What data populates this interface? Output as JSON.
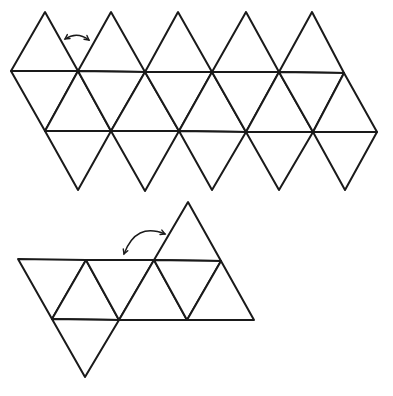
{
  "diagram": {
    "title": "",
    "colors": {
      "stroke": "#1a1a1a",
      "background": "#ffffff"
    },
    "icosahedron_net": {
      "triangle_count": 20,
      "vertices_rows": {
        "top_apexes": [
          [
            45,
            12
          ],
          [
            111,
            12
          ],
          [
            178,
            12
          ],
          [
            246,
            12
          ],
          [
            312,
            12
          ]
        ],
        "upper_row": [
          [
            11,
            71
          ],
          [
            78,
            71
          ],
          [
            145,
            72
          ],
          [
            212,
            72
          ],
          [
            279,
            72
          ],
          [
            344,
            73
          ]
        ],
        "lower_row": [
          [
            45,
            131
          ],
          [
            111,
            131
          ],
          [
            179,
            131
          ],
          [
            246,
            132
          ],
          [
            313,
            132
          ],
          [
            377,
            132
          ]
        ],
        "bottom_points": [
          [
            78,
            190
          ],
          [
            145,
            191
          ],
          [
            212,
            190
          ],
          [
            279,
            190
          ],
          [
            345,
            190
          ]
        ]
      },
      "fold_arrow": {
        "from": [
          65,
          39
        ],
        "to": [
          89,
          40
        ],
        "bidirectional": true
      }
    },
    "partial_net": {
      "triangle_count": 9,
      "apex": [
        188,
        202
      ],
      "top_row": [
        [
          18,
          259
        ],
        [
          86,
          260
        ],
        [
          154,
          260
        ],
        [
          221,
          261
        ]
      ],
      "middle_row": [
        [
          52,
          319
        ],
        [
          119,
          320
        ],
        [
          187,
          320
        ],
        [
          254,
          320
        ]
      ],
      "bottom_point": [
        85,
        377
      ],
      "fold_arrow": {
        "from": [
          165,
          234
        ],
        "to": [
          124,
          254
        ],
        "bidirectional": true
      }
    }
  }
}
